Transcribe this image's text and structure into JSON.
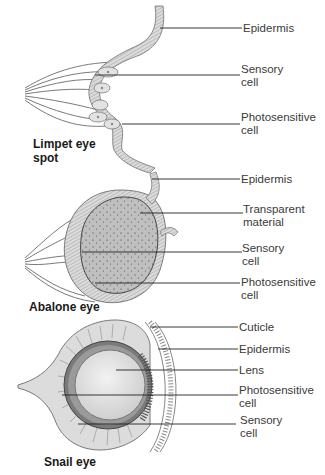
{
  "panels": [
    {
      "title": "Limpet eye\nspot",
      "labels": [
        "Epidermis",
        "Sensory\ncell",
        "Photosensitive\ncell"
      ]
    },
    {
      "title": "Abalone eye",
      "labels": [
        "Epidermis",
        "Transparent\nmaterial",
        "Sensory\ncell",
        "Photosensitive\ncell"
      ]
    },
    {
      "title": "Snail eye",
      "labels": [
        "Cuticle",
        "Epidermis",
        "Lens",
        "Photosensitive\ncell",
        "Sensory\ncell"
      ]
    }
  ],
  "colors": {
    "tissue": "#d9d9d9",
    "tissue_stroke": "#6e6e6e",
    "lens": "#e6e6e6",
    "transparent_material": "#bdbdbd",
    "leader_line": "#222222"
  }
}
